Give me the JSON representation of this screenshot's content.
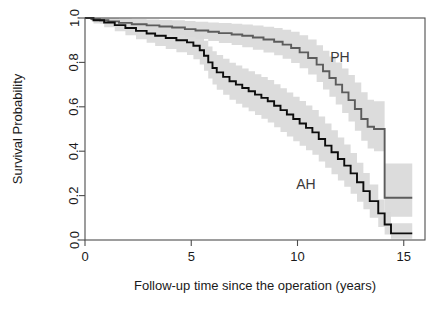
{
  "chart_data": {
    "type": "line",
    "subtype": "kaplan-meier-survival",
    "title": "",
    "xlabel": "Follow-up time since the operation (years)",
    "ylabel": "Survival Probability",
    "xlim": [
      0,
      16
    ],
    "ylim": [
      0,
      1
    ],
    "xticks": [
      0,
      5,
      10,
      15
    ],
    "xticklabels": [
      "0",
      "5",
      "10",
      "15"
    ],
    "yticks": [
      0.0,
      0.2,
      0.4,
      0.6,
      0.8,
      1.0
    ],
    "yticklabels": [
      "0.0",
      "0.2",
      "0.4",
      "0.6",
      "0.8",
      "1.0"
    ],
    "grid": false,
    "legend": "inline-annotations",
    "annotations": [
      {
        "text": "PH",
        "x": 12.0,
        "y": 0.8
      },
      {
        "text": "AH",
        "x": 10.4,
        "y": 0.23
      }
    ],
    "colors": {
      "ph_curve": "#5c5c5c",
      "ah_curve": "#0d0d0d",
      "confidence_band": "#d9d9d9",
      "axis": "#4d4d4d",
      "background": "#ffffff"
    },
    "series": [
      {
        "name": "PH",
        "color": "#5c5c5c",
        "step": "post",
        "x": [
          0.0,
          0.3,
          0.7,
          1.1,
          1.6,
          2.2,
          2.9,
          3.5,
          4.1,
          4.7,
          5.2,
          5.8,
          6.3,
          6.9,
          7.4,
          7.9,
          8.4,
          8.9,
          9.3,
          9.7,
          10.1,
          10.5,
          10.9,
          11.2,
          11.5,
          11.8,
          12.1,
          12.4,
          12.7,
          13.0,
          13.3,
          13.6,
          13.9,
          14.1,
          14.3,
          15.4
        ],
        "y": [
          1.0,
          0.995,
          0.99,
          0.985,
          0.978,
          0.972,
          0.967,
          0.962,
          0.957,
          0.95,
          0.944,
          0.938,
          0.932,
          0.926,
          0.92,
          0.912,
          0.903,
          0.893,
          0.88,
          0.865,
          0.845,
          0.82,
          0.79,
          0.76,
          0.73,
          0.7,
          0.665,
          0.63,
          0.59,
          0.545,
          0.51,
          0.5,
          0.5,
          0.19,
          0.19,
          0.19
        ],
        "ci_lower": [
          1.0,
          0.985,
          0.975,
          0.968,
          0.958,
          0.948,
          0.94,
          0.932,
          0.924,
          0.914,
          0.905,
          0.896,
          0.887,
          0.878,
          0.868,
          0.857,
          0.845,
          0.832,
          0.816,
          0.797,
          0.774,
          0.745,
          0.712,
          0.678,
          0.645,
          0.61,
          0.572,
          0.534,
          0.492,
          0.447,
          0.412,
          0.4,
          0.4,
          0.105,
          0.105,
          0.105
        ],
        "ci_upper": [
          1.0,
          1.0,
          1.0,
          1.0,
          0.998,
          0.995,
          0.993,
          0.991,
          0.99,
          0.986,
          0.983,
          0.98,
          0.977,
          0.974,
          0.971,
          0.966,
          0.961,
          0.955,
          0.947,
          0.938,
          0.922,
          0.903,
          0.877,
          0.852,
          0.827,
          0.8,
          0.773,
          0.743,
          0.709,
          0.666,
          0.632,
          0.625,
          0.625,
          0.345,
          0.345,
          0.345
        ]
      },
      {
        "name": "AH",
        "color": "#0d0d0d",
        "step": "post",
        "x": [
          0.0,
          0.4,
          0.9,
          1.4,
          1.9,
          2.4,
          2.9,
          3.3,
          3.8,
          4.3,
          4.8,
          5.1,
          5.4,
          5.6,
          5.8,
          6.0,
          6.2,
          6.5,
          6.8,
          7.1,
          7.4,
          7.7,
          8.0,
          8.3,
          8.6,
          8.9,
          9.2,
          9.5,
          9.8,
          10.1,
          10.4,
          10.7,
          11.0,
          11.3,
          11.6,
          11.9,
          12.2,
          12.5,
          12.8,
          13.1,
          13.4,
          13.8,
          14.1,
          14.4,
          15.4
        ],
        "y": [
          1.0,
          0.99,
          0.98,
          0.968,
          0.955,
          0.942,
          0.93,
          0.92,
          0.91,
          0.9,
          0.89,
          0.875,
          0.855,
          0.83,
          0.8,
          0.775,
          0.755,
          0.735,
          0.715,
          0.7,
          0.685,
          0.67,
          0.655,
          0.64,
          0.625,
          0.605,
          0.585,
          0.565,
          0.545,
          0.525,
          0.505,
          0.485,
          0.455,
          0.425,
          0.395,
          0.365,
          0.335,
          0.3,
          0.26,
          0.22,
          0.175,
          0.12,
          0.07,
          0.03,
          0.03
        ],
        "ci_lower": [
          1.0,
          0.975,
          0.958,
          0.94,
          0.922,
          0.904,
          0.888,
          0.874,
          0.86,
          0.846,
          0.833,
          0.814,
          0.79,
          0.762,
          0.728,
          0.7,
          0.677,
          0.654,
          0.632,
          0.614,
          0.597,
          0.58,
          0.563,
          0.546,
          0.529,
          0.508,
          0.487,
          0.466,
          0.445,
          0.424,
          0.404,
          0.384,
          0.354,
          0.325,
          0.296,
          0.268,
          0.24,
          0.208,
          0.172,
          0.138,
          0.1,
          0.058,
          0.025,
          0.006,
          0.006
        ],
        "ci_upper": [
          1.0,
          1.0,
          1.0,
          0.996,
          0.988,
          0.98,
          0.972,
          0.966,
          0.96,
          0.954,
          0.947,
          0.936,
          0.92,
          0.898,
          0.872,
          0.85,
          0.833,
          0.816,
          0.798,
          0.786,
          0.773,
          0.76,
          0.747,
          0.734,
          0.721,
          0.702,
          0.683,
          0.664,
          0.645,
          0.626,
          0.606,
          0.586,
          0.556,
          0.525,
          0.494,
          0.462,
          0.43,
          0.392,
          0.348,
          0.302,
          0.25,
          0.182,
          0.125,
          0.075,
          0.075
        ]
      }
    ]
  },
  "figure": {
    "geometry": {
      "plot_left": 85,
      "plot_right": 425,
      "plot_top": 18,
      "plot_bottom": 240
    }
  }
}
